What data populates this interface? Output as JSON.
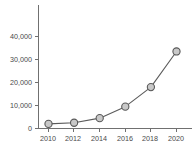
{
  "chart_data": {
    "type": "line",
    "title": "",
    "xlabel": "",
    "ylabel": "",
    "categories": [
      "2010",
      "2012",
      "2014",
      "2016",
      "2018",
      "2020"
    ],
    "x": [
      2010,
      2012,
      2014,
      2016,
      2018,
      2020
    ],
    "values": [
      2000,
      2500,
      4500,
      9500,
      18000,
      33500
    ],
    "series": [
      {
        "name": "",
        "values": [
          2000,
          2500,
          4500,
          9500,
          18000,
          33500
        ]
      }
    ],
    "xlim": [
      2009,
      2021
    ],
    "ylim": [
      0,
      45000
    ],
    "y_ticks": [
      0,
      10000,
      20000,
      30000,
      40000
    ],
    "y_tick_labels": [
      "0",
      "10,000",
      "20,000",
      "30,000",
      "40,000"
    ],
    "x_ticks": [
      2010,
      2012,
      2014,
      2016,
      2018,
      2020
    ],
    "x_tick_labels": [
      "2010",
      "2012",
      "2014",
      "2016",
      "2018",
      "2020"
    ],
    "grid": false,
    "legend": false,
    "legend_position": "none",
    "marker": "circle",
    "colors": {
      "line": "#5b5b5b",
      "marker_fill": "#c9c9c9",
      "marker_edge": "#595959",
      "axis": "#707070",
      "tick_text": "#4a4a4a",
      "background": "#ffffff"
    }
  },
  "y_axis_labels": [
    {
      "text": "40,000",
      "y": 36
    },
    {
      "text": "30,000",
      "y": 59
    },
    {
      "text": "20,000",
      "y": 82
    },
    {
      "text": "10,000",
      "y": 105
    },
    {
      "text": "0",
      "y": 128
    }
  ],
  "x_axis_labels": [
    {
      "text": "2010",
      "x": 48
    },
    {
      "text": "2012",
      "x": 73
    },
    {
      "text": "2014",
      "x": 99
    },
    {
      "text": "2016",
      "x": 125
    },
    {
      "text": "2018",
      "x": 150
    },
    {
      "text": "2020",
      "x": 176
    }
  ]
}
